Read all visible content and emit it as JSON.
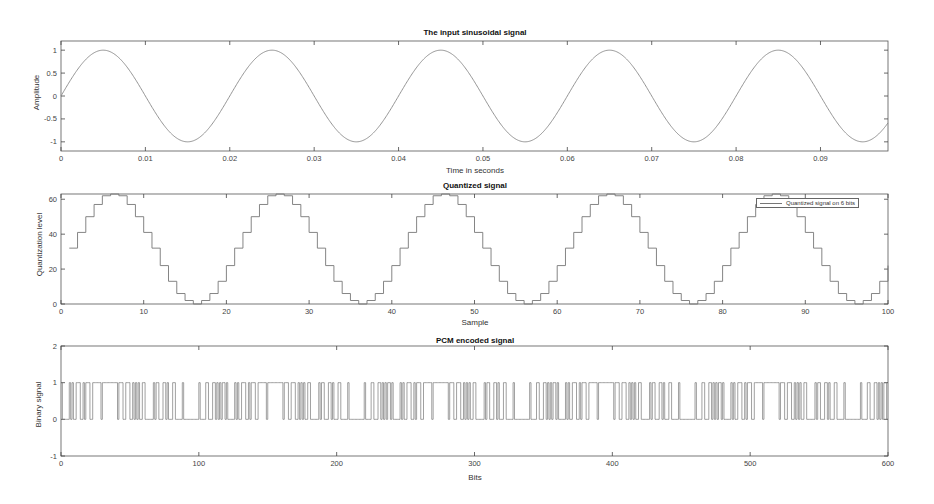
{
  "chart_data": [
    {
      "type": "line",
      "title": "The input sinusoidal signal",
      "xlabel": "Time in seconds",
      "ylabel": "Amplitude",
      "xlim": [
        0,
        0.098
      ],
      "ylim": [
        -1.2,
        1.2
      ],
      "xticks": [
        "0",
        "0.01",
        "0.02",
        "0.03",
        "0.04",
        "0.05",
        "0.06",
        "0.07",
        "0.08",
        "0.09"
      ],
      "yticks": [
        "-1",
        "-0.5",
        "0",
        "0.5",
        "1"
      ],
      "grid": false,
      "series": [
        {
          "name": "sin(2*pi*50*t)",
          "frequency_hz": 50,
          "amplitude": 1,
          "x_start": 0,
          "x_end": 0.099
        }
      ]
    },
    {
      "type": "line",
      "step": true,
      "title": "Quantized signal",
      "xlabel": "Sample",
      "ylabel": "Quantization level",
      "xlim": [
        0,
        100
      ],
      "ylim": [
        0,
        63
      ],
      "xticks": [
        "0",
        "10",
        "20",
        "30",
        "40",
        "50",
        "60",
        "70",
        "80",
        "90",
        "100"
      ],
      "yticks": [
        "0",
        "20",
        "40",
        "60"
      ],
      "grid": false,
      "legend": {
        "position": "upper right",
        "entries": [
          "Quantized signal on 6 bits"
        ]
      },
      "series": [
        {
          "name": "Quantized signal on 6 bits",
          "x_start": 1,
          "period_values": [
            32,
            41,
            50,
            57,
            62,
            63,
            62,
            57,
            50,
            41,
            32,
            22,
            13,
            6,
            2,
            0,
            2,
            6,
            13,
            22
          ],
          "num_samples": 100
        }
      ]
    },
    {
      "type": "line",
      "step": true,
      "title": "PCM encoded signal",
      "xlabel": "Bits",
      "ylabel": "Binary signal",
      "xlim": [
        0,
        600
      ],
      "ylim": [
        -1,
        2
      ],
      "xticks": [
        "0",
        "100",
        "200",
        "300",
        "400",
        "500",
        "600"
      ],
      "yticks": [
        "-1",
        "0",
        "1",
        "2"
      ],
      "grid": false,
      "series": [
        {
          "name": "PCM bits (6 bits per sample, 100 samples)",
          "num_bits": 600,
          "bits_per_sample": 6,
          "levels": [
            0,
            1
          ]
        }
      ]
    }
  ],
  "panels": {
    "top": {
      "title": "The input sinusoidal signal",
      "xlabel": "Time in seconds",
      "ylabel": "Amplitude",
      "xticks": [
        "0",
        "0.01",
        "0.02",
        "0.03",
        "0.04",
        "0.05",
        "0.06",
        "0.07",
        "0.08",
        "0.09"
      ],
      "yticks": [
        "1",
        "0.5",
        "0",
        "-0.5",
        "-1"
      ]
    },
    "middle": {
      "title": "Quantized signal",
      "xlabel": "Sample",
      "ylabel": "Quantization level",
      "legend": "Quantized signal on 6 bits",
      "xticks": [
        "0",
        "10",
        "20",
        "30",
        "40",
        "50",
        "60",
        "70",
        "80",
        "90",
        "100"
      ],
      "yticks": [
        "60",
        "40",
        "20",
        "0"
      ]
    },
    "bottom": {
      "title": "PCM encoded signal",
      "xlabel": "Bits",
      "ylabel": "Binary signal",
      "xticks": [
        "0",
        "100",
        "200",
        "300",
        "400",
        "500",
        "600"
      ],
      "yticks": [
        "2",
        "1",
        "0",
        "-1"
      ]
    }
  }
}
